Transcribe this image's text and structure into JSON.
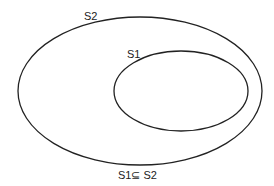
{
  "diagram": {
    "type": "venn-subset",
    "sets": [
      {
        "id": "S2",
        "label": "S2",
        "role": "outer",
        "cx": 140,
        "cy": 91,
        "rx": 122,
        "ry": 74
      },
      {
        "id": "S1",
        "label": "S1",
        "role": "inner",
        "cx": 181,
        "cy": 91,
        "rx": 68,
        "ry": 40
      }
    ],
    "caption": "S1⊆ S2",
    "stroke_color": "#222222",
    "background": "#ffffff"
  }
}
